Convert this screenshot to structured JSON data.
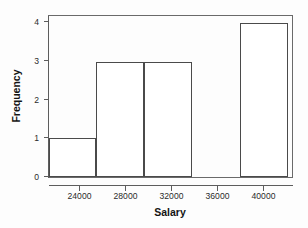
{
  "chart_data": {
    "type": "bar",
    "title": "",
    "xlabel": "Salary",
    "ylabel": "Frequency",
    "xlim": [
      22000,
      42400
    ],
    "ylim": [
      0,
      4.2
    ],
    "grid": false,
    "legend": "none",
    "bin_width": 4000,
    "x_ticks": [
      24000,
      28000,
      32000,
      36000,
      40000
    ],
    "x_tick_labels": [
      "24000",
      "28000",
      "32000",
      "36000",
      "40000"
    ],
    "y_ticks": [
      0,
      1,
      2,
      3,
      4
    ],
    "y_tick_labels": [
      "0",
      "1",
      "2",
      "3",
      "4"
    ],
    "bins": [
      {
        "label": "22000-26000",
        "x0": 22000,
        "x1": 26000,
        "value": 1
      },
      {
        "label": "26000-30000",
        "x0": 26000,
        "x1": 30000,
        "value": 3
      },
      {
        "label": "30000-34000",
        "x0": 30000,
        "x1": 34000,
        "value": 3
      },
      {
        "label": "34000-38000",
        "x0": 34000,
        "x1": 38000,
        "value": 0
      },
      {
        "label": "38000-42000",
        "x0": 38000,
        "x1": 42000,
        "value": 4
      }
    ],
    "categories": [
      "22000-26000",
      "26000-30000",
      "30000-34000",
      "34000-38000",
      "38000-42000"
    ],
    "values": [
      1,
      3,
      3,
      0,
      4
    ],
    "colors": {
      "bar_fill": "#ffffff",
      "bar_stroke": "#4a4a4a",
      "axis": "#5d5d5d",
      "box": "#6a6a6a",
      "text": "#2b2b2b",
      "background": "#fdfdfd"
    }
  }
}
